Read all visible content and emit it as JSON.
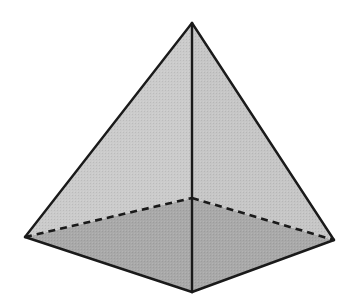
{
  "diagram": {
    "title": "Square pyramid",
    "shape": "square-pyramid",
    "colors": {
      "background": "#ffffff",
      "side_face": "#c9c9c9",
      "side_face_left": "#cbcbcb",
      "side_face_right": "#c6c6c6",
      "base_face": "#a9a9a9",
      "edge": "#1a1a1a"
    },
    "vertices": {
      "apex": [
        192,
        23
      ],
      "base_left": [
        25,
        237
      ],
      "base_front": [
        192,
        292
      ],
      "base_right": [
        334,
        240
      ],
      "base_back_hidden": [
        192,
        198
      ]
    },
    "edges": {
      "visible": [
        [
          "apex",
          "base_left"
        ],
        [
          "apex",
          "base_right"
        ],
        [
          "apex",
          "base_front"
        ],
        [
          "base_left",
          "base_front"
        ],
        [
          "base_front",
          "base_right"
        ]
      ],
      "hidden_dashed": [
        [
          "base_left",
          "base_back_hidden"
        ],
        [
          "base_back_hidden",
          "base_right"
        ]
      ]
    }
  }
}
